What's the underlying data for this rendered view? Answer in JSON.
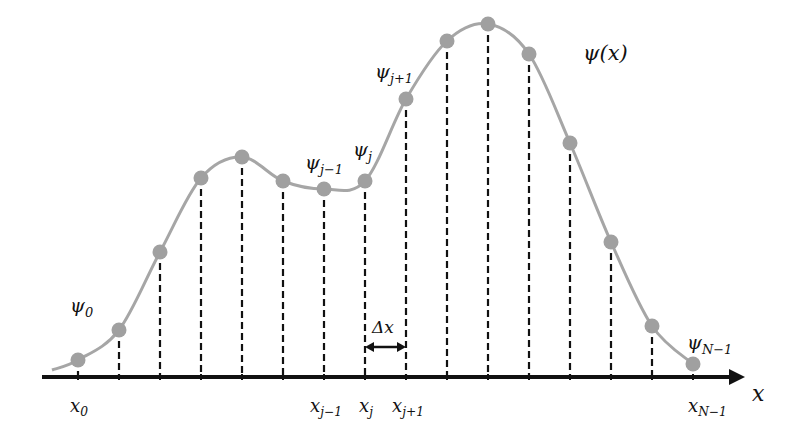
{
  "diagram": {
    "curve_label": {
      "main": "ψ(x)"
    },
    "axis": {
      "label": "x",
      "y": 377,
      "x_start": 42,
      "x_end": 745
    },
    "delta_label": {
      "main": "Δx"
    },
    "colors": {
      "curve": "#a6a6a6",
      "points": "#a0a0a0",
      "axis": "#111111",
      "dashes": "#111111",
      "text": "#111111"
    },
    "points": [
      {
        "x": 78,
        "y": 360
      },
      {
        "x": 119,
        "y": 330
      },
      {
        "x": 160,
        "y": 252
      },
      {
        "x": 201,
        "y": 178
      },
      {
        "x": 242,
        "y": 157
      },
      {
        "x": 283,
        "y": 181
      },
      {
        "x": 324,
        "y": 189
      },
      {
        "x": 365,
        "y": 181
      },
      {
        "x": 406,
        "y": 99
      },
      {
        "x": 447,
        "y": 41
      },
      {
        "x": 488,
        "y": 24
      },
      {
        "x": 529,
        "y": 54
      },
      {
        "x": 570,
        "y": 143
      },
      {
        "x": 611,
        "y": 242
      },
      {
        "x": 652,
        "y": 326
      },
      {
        "x": 693,
        "y": 364
      }
    ],
    "psi_labels": [
      {
        "main": "ψ",
        "sub": "0",
        "left": 70,
        "top": 296
      },
      {
        "main": "ψ",
        "sub": "j−1",
        "left": 305,
        "top": 153
      },
      {
        "main": "ψ",
        "sub": "j",
        "left": 353,
        "top": 140
      },
      {
        "main": "ψ",
        "sub": "j+1",
        "left": 375,
        "top": 62
      },
      {
        "main": "ψ",
        "sub": "N−1",
        "left": 687,
        "top": 333
      }
    ],
    "x_labels": [
      {
        "main": "x",
        "sub": "0",
        "left": 70,
        "top": 397
      },
      {
        "main": "x",
        "sub": "j−1",
        "left": 310,
        "top": 397
      },
      {
        "main": "x",
        "sub": "j",
        "left": 359,
        "top": 397
      },
      {
        "main": "x",
        "sub": "j+1",
        "left": 392,
        "top": 397
      },
      {
        "main": "x",
        "sub": "N−1",
        "left": 688,
        "top": 397
      }
    ]
  }
}
